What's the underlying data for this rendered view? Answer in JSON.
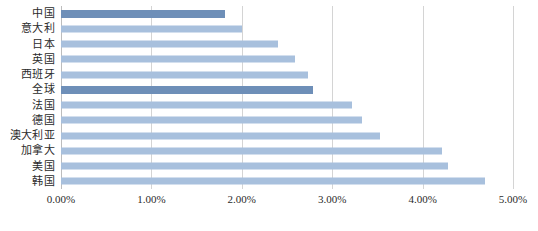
{
  "chart_data": {
    "type": "bar",
    "orientation": "horizontal",
    "title": "",
    "xlabel": "",
    "ylabel": "",
    "xlim": [
      0,
      5
    ],
    "x_tick_labels": [
      "0.00%",
      "1.00%",
      "2.00%",
      "3.00%",
      "4.00%",
      "5.00%"
    ],
    "x_tick_values": [
      0,
      1,
      2,
      3,
      4,
      5
    ],
    "grid": true,
    "legend": false,
    "value_unit": "%",
    "categories": [
      "中国",
      "意大利",
      "日本",
      "英国",
      "西班牙",
      "全球",
      "法国",
      "德国",
      "澳大利亚",
      "加拿大",
      "美国",
      "韩国"
    ],
    "values": [
      1.81,
      2.0,
      2.4,
      2.59,
      2.73,
      2.79,
      3.22,
      3.33,
      3.53,
      4.21,
      4.28,
      4.69
    ],
    "bars": [
      {
        "label": "中国",
        "value": 1.81,
        "highlight": true
      },
      {
        "label": "意大利",
        "value": 2.0,
        "highlight": false
      },
      {
        "label": "日本",
        "value": 2.4,
        "highlight": false
      },
      {
        "label": "英国",
        "value": 2.59,
        "highlight": false
      },
      {
        "label": "西班牙",
        "value": 2.73,
        "highlight": false
      },
      {
        "label": "全球",
        "value": 2.79,
        "highlight": true
      },
      {
        "label": "法国",
        "value": 3.22,
        "highlight": false
      },
      {
        "label": "德国",
        "value": 3.33,
        "highlight": false
      },
      {
        "label": "澳大利亚",
        "value": 3.53,
        "highlight": false
      },
      {
        "label": "加拿大",
        "value": 4.21,
        "highlight": false
      },
      {
        "label": "美国",
        "value": 4.28,
        "highlight": false
      },
      {
        "label": "韩国",
        "value": 4.69,
        "highlight": false
      }
    ],
    "colors": {
      "bar": "#a8c0dd",
      "bar_highlight": "#6e8fb8",
      "gridline": "#d4d4d4",
      "axis": "#bdbdbd",
      "text": "#2b2b2b",
      "background": "#ffffff"
    }
  }
}
